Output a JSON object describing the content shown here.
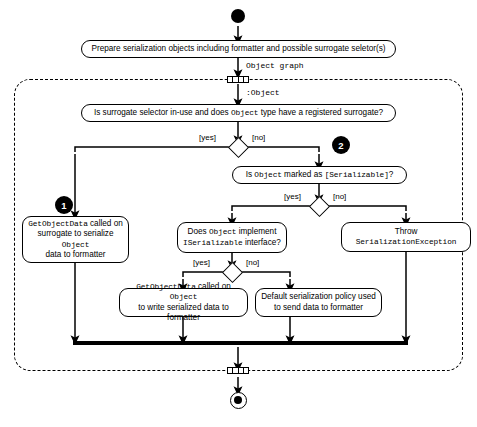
{
  "diagram": {
    "start_node": "start",
    "end_node": "end",
    "flow_labels": {
      "object_graph": "Object graph",
      "object_instance": ":Object"
    },
    "guards": {
      "yes": "[yes]",
      "no": "[no]"
    },
    "badges": [
      {
        "number": "1"
      },
      {
        "number": "2"
      }
    ],
    "nodes": {
      "prepare": {
        "text": "Prepare serialization objects including formatter and possible surrogate seletor(s)"
      },
      "decision_surrogate": {
        "part1": "Is surrogate selector in-use and does ",
        "code1": "Object",
        "part2": " type have a registered surrogate?"
      },
      "decision_serializable": {
        "part1": "Is ",
        "code1": "Object",
        "part2": " marked as ",
        "code2": "[Serializable]",
        "part3": "?"
      },
      "surrogate_getobjectdata": {
        "code1": "GetObjectData",
        "part1": " called on",
        "line2_part1": "surrogate to serialize ",
        "line2_code": "Object",
        "line3": "data to formatter"
      },
      "decision_iserializable": {
        "part1": "Does ",
        "code1": "Object",
        "part2": " implement",
        "line2_code": "ISerializable",
        "line2_part": " interface?"
      },
      "throw_exception": {
        "line1": "Throw",
        "line2_code": "SerializationException"
      },
      "object_getobjectdata": {
        "code1": "GetObjectData",
        "part1": " called on ",
        "code2": "Object",
        "line2": "to write serialized data to formatter"
      },
      "default_policy": {
        "line1": "Default serialization policy used",
        "line2": "to send data to formatter"
      }
    },
    "colors": {
      "stroke": "#000000",
      "fill": "#ffffff",
      "badge": "#000000"
    }
  }
}
